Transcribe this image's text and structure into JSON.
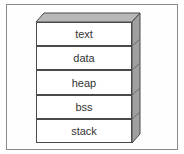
{
  "diagram": {
    "title": "",
    "segments": [
      {
        "label": "text"
      },
      {
        "label": "data"
      },
      {
        "label": "heap"
      },
      {
        "label": "bss"
      },
      {
        "label": "stack"
      }
    ],
    "colors": {
      "face": "#ffffff",
      "border": "#4a4a4a",
      "side": "#a0a0a0",
      "top": "#b8b8b8",
      "frame": "#8a8a8a"
    }
  }
}
